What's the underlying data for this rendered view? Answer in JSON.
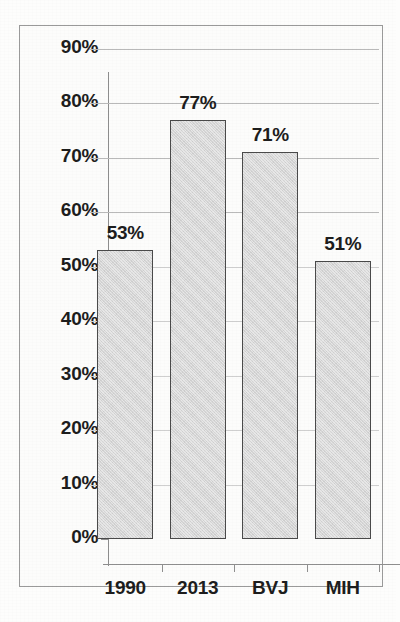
{
  "chart_data": {
    "type": "bar",
    "title": "",
    "xlabel": "",
    "ylabel": "",
    "categories": [
      "1990",
      "2013",
      "BVJ",
      "MIH"
    ],
    "values": [
      53,
      71,
      77,
      51
    ],
    "value_labels": [
      "53%",
      "77%",
      "71%",
      "51%"
    ],
    "series": [
      {
        "name": "",
        "values": [
          53,
          77,
          71,
          51
        ]
      }
    ],
    "ylim": [
      0,
      90
    ],
    "y_tick_values": [
      0,
      10,
      20,
      30,
      40,
      50,
      60,
      70,
      80,
      90
    ],
    "y_tick_labels": [
      "0%",
      "10%",
      "20%",
      "30%",
      "40%",
      "50%",
      "60%",
      "70%",
      "80%",
      "90%"
    ],
    "grid": true,
    "grid_axis": "y",
    "legend": false,
    "legend_position": "none",
    "bar_fill_color": "#d6d6d6",
    "bar_border_color": "#4a4a4a",
    "gridline_color": "#b9b9b9",
    "axis_color": "#8f8f8f",
    "text_color": "#1d1d1d",
    "background_color": "#fcfcfb",
    "frame_border_color": "#9a9a9a"
  }
}
